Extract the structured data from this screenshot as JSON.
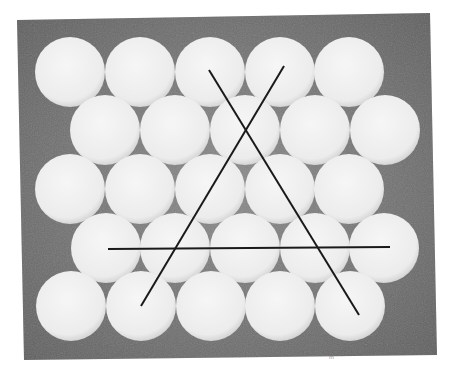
{
  "figure": {
    "background_color": "#6e6e6e",
    "disc_color": "#f2f2f2",
    "line_color": "#1a1a1a",
    "photo_corners": [
      [
        17,
        20
      ],
      [
        430,
        13
      ],
      [
        437,
        355
      ],
      [
        24,
        360
      ]
    ],
    "disc_radius": 35,
    "rows": [
      {
        "y": 72,
        "x": [
          70,
          140,
          210,
          280,
          349
        ]
      },
      {
        "y": 130,
        "x": [
          105,
          175,
          245,
          315,
          385
        ]
      },
      {
        "y": 189,
        "x": [
          70,
          140,
          210,
          280,
          349
        ]
      },
      {
        "y": 248,
        "x": [
          106,
          175,
          245,
          315,
          384
        ]
      },
      {
        "y": 306,
        "x": [
          71,
          141,
          211,
          280,
          350
        ]
      }
    ],
    "lines": [
      {
        "name": "diagonal-line-left-to-right",
        "x1": 209,
        "y1": 70,
        "x2": 359,
        "y2": 315
      },
      {
        "name": "diagonal-line-right-to-left",
        "x1": 284,
        "y1": 66,
        "x2": 141,
        "y2": 306
      },
      {
        "name": "horizontal-line",
        "x1": 108,
        "y1": 249,
        "x2": 390,
        "y2": 247
      }
    ],
    "caption_mark": "m"
  }
}
